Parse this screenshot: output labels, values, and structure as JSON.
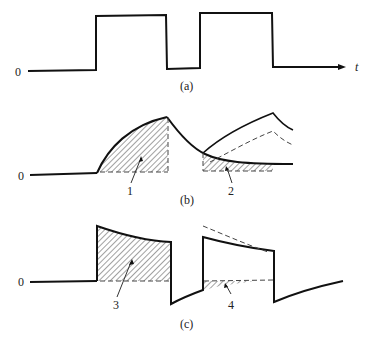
{
  "figure": {
    "panels": [
      {
        "id": "a",
        "caption": "(a)",
        "zero_label": "0",
        "axis_label": "t",
        "description": "Rectangular pulse train input: two positive pulses"
      },
      {
        "id": "b",
        "caption": "(b)",
        "zero_label": "0",
        "regions": [
          {
            "label": "1",
            "description": "Hatched area under rising exponential response during first pulse"
          },
          {
            "label": "2",
            "description": "Hatched area under decaying tail during second pulse"
          }
        ]
      },
      {
        "id": "c",
        "caption": "(c)",
        "zero_label": "0",
        "regions": [
          {
            "label": "3",
            "description": "Hatched area under decaying response during first pulse"
          },
          {
            "label": "4",
            "description": "Hatched area between baseline and undershoot during second pulse"
          }
        ]
      }
    ],
    "colors": {
      "line": "#111111",
      "dashed": "#444444",
      "background": "#ffffff"
    }
  }
}
